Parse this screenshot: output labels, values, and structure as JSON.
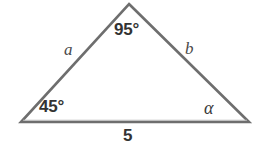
{
  "figure": {
    "background_color": "#ffffff",
    "stroke_color": "#6e6e6e",
    "stroke_width": 2.6,
    "text_color": "#333333",
    "vertices": {
      "apex": {
        "x": 129,
        "y": 4
      },
      "bottom_left": {
        "x": 21,
        "y": 122
      },
      "bottom_right": {
        "x": 249,
        "y": 122
      }
    },
    "labels": {
      "apex_angle": "95°",
      "left_angle": "45°",
      "right_angle": "α",
      "side_a": "a",
      "side_b": "b",
      "base_length": "5"
    }
  },
  "chart_data": {
    "type": "diagram",
    "shape": "triangle",
    "angles": [
      {
        "name": "apex",
        "label": "95°",
        "value": 95,
        "unit": "degrees",
        "vertex": "top"
      },
      {
        "name": "left",
        "label": "45°",
        "value": 45,
        "unit": "degrees",
        "vertex": "bottom-left"
      },
      {
        "name": "right",
        "label": "α",
        "value": null,
        "unit": "degrees",
        "vertex": "bottom-right"
      }
    ],
    "sides": [
      {
        "name": "a",
        "label": "a",
        "value": null,
        "between": [
          "bottom-left",
          "apex"
        ]
      },
      {
        "name": "b",
        "label": "b",
        "value": null,
        "between": [
          "apex",
          "bottom-right"
        ]
      },
      {
        "name": "base",
        "label": "5",
        "value": 5,
        "between": [
          "bottom-left",
          "bottom-right"
        ]
      }
    ],
    "xlabel": "",
    "ylabel": "",
    "grid": false,
    "legend": false
  }
}
